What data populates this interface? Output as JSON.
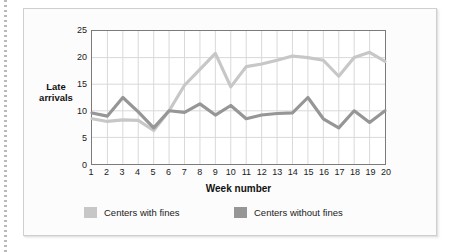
{
  "figure": {
    "y_axis_label": "Late arrivals",
    "y_axis_label_line1": "Late",
    "y_axis_label_line2": "arrivals",
    "x_axis_label": "Week number"
  },
  "colors": {
    "series_with_fines": "#c7c7c7",
    "series_without_fines": "#969696",
    "axis": "#7b7b7b",
    "grid": "#d9d9d9",
    "plot_background": "#ffffff",
    "figure_background": "#fcfcfc",
    "figure_border": "#cfcfcf",
    "text": "#1a1a1a"
  },
  "chart_data": {
    "type": "line",
    "title": "",
    "xlabel": "Week number",
    "ylabel": "Late arrivals",
    "xlim": [
      1,
      20
    ],
    "ylim": [
      0,
      25
    ],
    "yticks": [
      0,
      5,
      10,
      15,
      20,
      25
    ],
    "xticks": [
      1,
      2,
      3,
      4,
      5,
      6,
      7,
      8,
      9,
      10,
      11,
      12,
      13,
      14,
      15,
      16,
      17,
      18,
      19,
      20
    ],
    "grid": true,
    "legend_position": "bottom",
    "x": [
      1,
      2,
      3,
      4,
      5,
      6,
      7,
      8,
      9,
      10,
      11,
      12,
      13,
      14,
      15,
      16,
      17,
      18,
      19,
      20
    ],
    "categories": [
      "1",
      "2",
      "3",
      "4",
      "5",
      "6",
      "7",
      "8",
      "9",
      "10",
      "11",
      "12",
      "13",
      "14",
      "15",
      "16",
      "17",
      "18",
      "19",
      "20"
    ],
    "series": [
      {
        "name": "Centers with fines",
        "color": "#c7c7c7",
        "values": [
          8.5,
          8.0,
          8.3,
          8.2,
          6.3,
          10.0,
          14.8,
          17.8,
          20.8,
          14.5,
          18.3,
          18.8,
          19.5,
          20.3,
          20.0,
          19.5,
          16.5,
          20.0,
          21.0,
          19.3
        ]
      },
      {
        "name": "Centers without fines",
        "color": "#969696",
        "values": [
          9.6,
          9.0,
          12.5,
          9.8,
          6.8,
          10.0,
          9.7,
          11.3,
          9.2,
          11.0,
          8.5,
          9.2,
          9.5,
          9.6,
          12.5,
          8.5,
          6.8,
          10.0,
          7.8,
          10.0
        ]
      }
    ]
  },
  "legend": {
    "items": [
      {
        "label": "Centers with fines",
        "color": "#c7c7c7"
      },
      {
        "label": "Centers without fines",
        "color": "#969696"
      }
    ]
  }
}
